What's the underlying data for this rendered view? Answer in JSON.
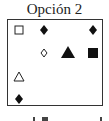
{
  "title": "Opción 2",
  "grid": {
    "symbols": [
      {
        "shape": "hollow-square",
        "x": 19,
        "y": 30
      },
      {
        "shape": "filled-diamond",
        "x": 44,
        "y": 30
      },
      {
        "shape": "filled-diamond",
        "x": 93,
        "y": 30
      },
      {
        "shape": "hollow-diamond",
        "x": 44,
        "y": 53
      },
      {
        "shape": "filled-triangle",
        "x": 68,
        "y": 53
      },
      {
        "shape": "filled-square",
        "x": 93,
        "y": 53
      },
      {
        "shape": "hollow-triangle",
        "x": 19,
        "y": 77
      },
      {
        "shape": "filled-diamond",
        "x": 19,
        "y": 99
      }
    ]
  },
  "colors": {
    "ink": "#111111",
    "border": "#333333"
  }
}
